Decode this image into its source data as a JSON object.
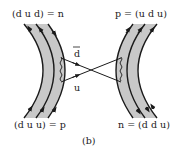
{
  "diagram": {
    "caption": "(b)",
    "top_left_label": "(d u d) = n",
    "top_right_label": "p = (u d u)",
    "bottom_left_label": "(d u u) = p",
    "bottom_right_label": "n = (d d u)",
    "exchange_antiquark": "d",
    "exchange_quark": "u",
    "colors": {
      "band_fill": "#c8c8c8",
      "line": "#1a1a1a",
      "background": "#ffffff"
    }
  }
}
